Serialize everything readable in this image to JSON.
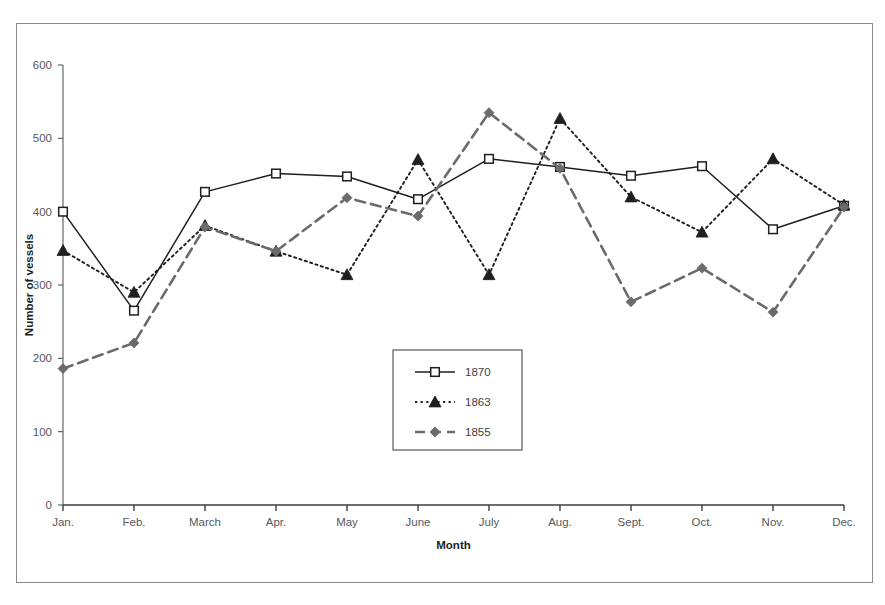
{
  "chart_data": {
    "type": "line",
    "title": "",
    "xlabel": "Month",
    "ylabel": "Number of vessels",
    "categories": [
      "Jan.",
      "Feb.",
      "March",
      "Apr.",
      "May",
      "June",
      "July",
      "Aug.",
      "Sept.",
      "Oct.",
      "Nov.",
      "Dec."
    ],
    "ylim": [
      0,
      600
    ],
    "yticks": [
      0,
      100,
      200,
      300,
      400,
      500,
      600
    ],
    "grid": false,
    "legend_position": "center",
    "series": [
      {
        "name": "1870",
        "marker": "open-square",
        "line_style": "solid",
        "color": "#1d1f21",
        "values": [
          400,
          265,
          427,
          452,
          448,
          417,
          472,
          461,
          449,
          462,
          376,
          408
        ]
      },
      {
        "name": "1863",
        "marker": "filled-triangle",
        "line_style": "dotted",
        "color": "#1d1f21",
        "values": [
          347,
          290,
          381,
          346,
          314,
          471,
          314,
          527,
          420,
          372,
          472,
          409
        ]
      },
      {
        "name": "1855",
        "marker": "filled-diamond",
        "line_style": "dashed",
        "color": "#6b6b6b",
        "values": [
          186,
          221,
          379,
          346,
          419,
          394,
          535,
          459,
          277,
          323,
          263,
          406
        ]
      }
    ]
  },
  "legend": {
    "entries": [
      {
        "label": "1870"
      },
      {
        "label": "1863"
      },
      {
        "label": "1855"
      }
    ]
  },
  "axes": {
    "y_title": "Number of vessels",
    "x_title": "Month",
    "y_tick_labels": [
      "600",
      "500",
      "400",
      "300",
      "200",
      "100",
      "0"
    ],
    "x_tick_labels": [
      "Jan.",
      "Feb.",
      "March",
      "Apr.",
      "May",
      "June",
      "July",
      "Aug.",
      "Sept.",
      "Oct.",
      "Nov.",
      "Dec."
    ]
  },
  "colors": {
    "frame": "#8a8a8a",
    "axis": "#55595c",
    "series_1870": "#1d1f21",
    "series_1863": "#1d1f21",
    "series_1855": "#6b6b6b"
  }
}
